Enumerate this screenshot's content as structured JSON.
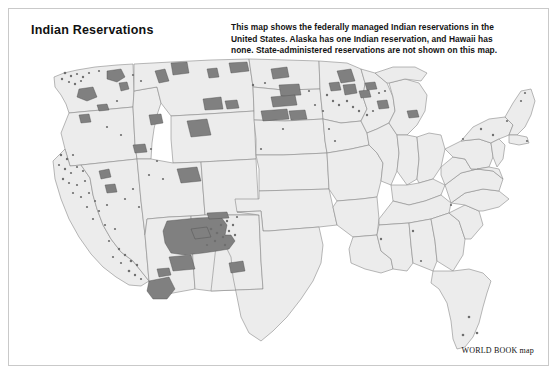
{
  "frame": {
    "border_color": "#c9c9c9",
    "background": "#ffffff"
  },
  "header": {
    "title": "Indian Reservations",
    "description_lines": [
      "This map shows the federally managed Indian reservations in the",
      "United States. Alaska has one Indian reservation, and Hawaii has",
      "none. State-administered reservations are not shown on this map."
    ]
  },
  "credit": {
    "text": "WORLD BOOK map"
  },
  "map": {
    "region": "Contiguous United States",
    "state_fill": "#ececec",
    "state_stroke": "#8a8a8a",
    "reservation_fill": "#808080",
    "reservation_stroke": "#4a4a4a",
    "legend_note": "Shaded areas denote federally managed Indian reservations",
    "notable_reservation_clusters": [
      "Navajo Nation (Four Corners)",
      "Wind River, Wyoming",
      "Pine Ridge and Rosebud, South Dakota",
      "Fort Peck and Crow, Montana",
      "Uintah and Ouray, Utah",
      "Tohono O'odham and Gila River, Arizona",
      "Yakama and Colville, Washington",
      "Red Lake and Leech Lake, Minnesota",
      "Seminole, Florida",
      "California rancherias"
    ]
  }
}
